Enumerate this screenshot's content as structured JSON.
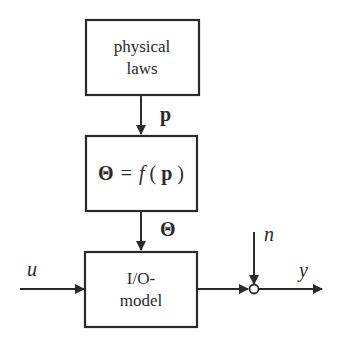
{
  "diagram": {
    "blocks": [
      {
        "id": "physical-laws",
        "lines": [
          "physical",
          "laws"
        ]
      },
      {
        "id": "parameter-map",
        "equation": {
          "lhs": "Θ",
          "eq": "=",
          "func": "f",
          "open": "(",
          "arg": "p",
          "close": ")"
        }
      },
      {
        "id": "io-model",
        "lines": [
          "I/O-",
          "model"
        ]
      }
    ],
    "signals": {
      "p": "p",
      "theta": "Θ",
      "u": "u",
      "n": "n",
      "y": "y"
    },
    "colors": {
      "stroke": "#2a2a2a",
      "background": "#ffffff"
    }
  }
}
